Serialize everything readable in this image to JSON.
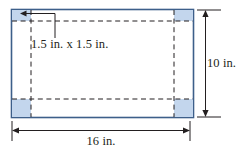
{
  "figure": {
    "sheet": {
      "name": "sheet-rectangle",
      "width_label": "16 in.",
      "height_label": "10 in.",
      "fill_color": "#ffffff",
      "stroke_color": "#3d5f8a"
    },
    "corner_squares": {
      "name": "corner-cut-squares",
      "count": 4,
      "label": "1.5 in. x 1.5 in.",
      "fill_color": "#c3d6ed",
      "stroke_color": "#3d5f8a"
    },
    "fold_lines": {
      "name": "dashed-fold-lines",
      "style": "dashed",
      "color": "#231f20"
    },
    "leader_line": {
      "name": "corner-leader-line",
      "color": "#231f20",
      "arrowhead": "left"
    },
    "dimension_lines": {
      "width": {
        "name": "width-dimension-line",
        "value": "16 in.",
        "orientation": "horizontal",
        "color": "#231f20"
      },
      "height": {
        "name": "height-dimension-line",
        "value": "10 in.",
        "orientation": "vertical",
        "color": "#231f20"
      }
    }
  }
}
